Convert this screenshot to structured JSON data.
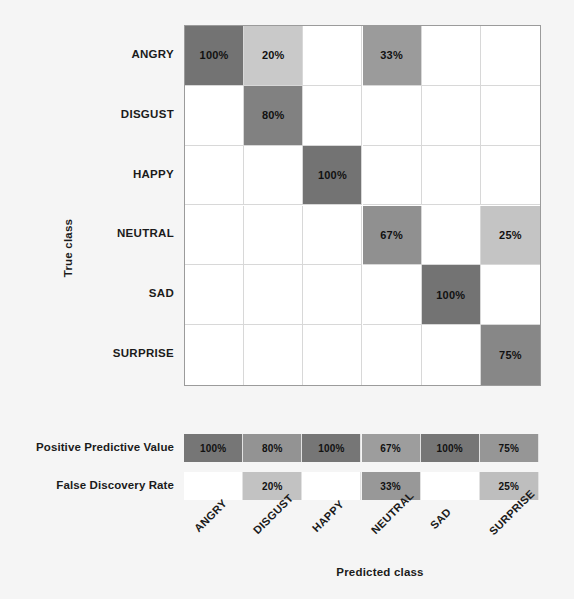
{
  "chart_data": {
    "type": "heatmap",
    "title": "",
    "xlabel": "Predicted class",
    "ylabel": "True class",
    "categories": [
      "ANGRY",
      "DISGUST",
      "HAPPY",
      "NEUTRAL",
      "SAD",
      "SURPRISE"
    ],
    "row_categories": [
      "ANGRY",
      "DISGUST",
      "HAPPY",
      "NEUTRAL",
      "SAD",
      "SURPRISE"
    ],
    "col_categories": [
      "ANGRY",
      "DISGUST",
      "HAPPY",
      "NEUTRAL",
      "SAD",
      "SURPRISE"
    ],
    "cell_unit": "%",
    "grid": true,
    "legend": "none",
    "matrix": [
      [
        {
          "text": "100%",
          "value": 100,
          "color": "#737373"
        },
        {
          "text": "20%",
          "value": 20,
          "color": "#c9c9c9"
        },
        {
          "text": "",
          "value": 0,
          "color": "#ffffff"
        },
        {
          "text": "33%",
          "value": 33,
          "color": "#9b9b9b"
        },
        {
          "text": "",
          "value": 0,
          "color": "#ffffff"
        },
        {
          "text": "",
          "value": 0,
          "color": "#ffffff"
        }
      ],
      [
        {
          "text": "",
          "value": 0,
          "color": "#ffffff"
        },
        {
          "text": "80%",
          "value": 80,
          "color": "#818181"
        },
        {
          "text": "",
          "value": 0,
          "color": "#ffffff"
        },
        {
          "text": "",
          "value": 0,
          "color": "#ffffff"
        },
        {
          "text": "",
          "value": 0,
          "color": "#ffffff"
        },
        {
          "text": "",
          "value": 0,
          "color": "#ffffff"
        }
      ],
      [
        {
          "text": "",
          "value": 0,
          "color": "#ffffff"
        },
        {
          "text": "",
          "value": 0,
          "color": "#ffffff"
        },
        {
          "text": "100%",
          "value": 100,
          "color": "#737373"
        },
        {
          "text": "",
          "value": 0,
          "color": "#ffffff"
        },
        {
          "text": "",
          "value": 0,
          "color": "#ffffff"
        },
        {
          "text": "",
          "value": 0,
          "color": "#ffffff"
        }
      ],
      [
        {
          "text": "",
          "value": 0,
          "color": "#ffffff"
        },
        {
          "text": "",
          "value": 0,
          "color": "#ffffff"
        },
        {
          "text": "",
          "value": 0,
          "color": "#ffffff"
        },
        {
          "text": "67%",
          "value": 67,
          "color": "#909090"
        },
        {
          "text": "",
          "value": 0,
          "color": "#ffffff"
        },
        {
          "text": "25%",
          "value": 25,
          "color": "#c4c4c4"
        }
      ],
      [
        {
          "text": "",
          "value": 0,
          "color": "#ffffff"
        },
        {
          "text": "",
          "value": 0,
          "color": "#ffffff"
        },
        {
          "text": "",
          "value": 0,
          "color": "#ffffff"
        },
        {
          "text": "",
          "value": 0,
          "color": "#ffffff"
        },
        {
          "text": "100%",
          "value": 100,
          "color": "#737373"
        },
        {
          "text": "",
          "value": 0,
          "color": "#ffffff"
        }
      ],
      [
        {
          "text": "",
          "value": 0,
          "color": "#ffffff"
        },
        {
          "text": "",
          "value": 0,
          "color": "#ffffff"
        },
        {
          "text": "",
          "value": 0,
          "color": "#ffffff"
        },
        {
          "text": "",
          "value": 0,
          "color": "#ffffff"
        },
        {
          "text": "",
          "value": 0,
          "color": "#ffffff"
        },
        {
          "text": "75%",
          "value": 75,
          "color": "#878787"
        }
      ]
    ],
    "summary_rows": [
      {
        "label": "Positive Predictive Value",
        "cells": [
          {
            "text": "100%",
            "value": 100,
            "color": "#767676"
          },
          {
            "text": "80%",
            "value": 80,
            "color": "#939393"
          },
          {
            "text": "100%",
            "value": 100,
            "color": "#767676"
          },
          {
            "text": "67%",
            "value": 67,
            "color": "#9d9d9d"
          },
          {
            "text": "100%",
            "value": 100,
            "color": "#767676"
          },
          {
            "text": "75%",
            "value": 75,
            "color": "#969696"
          }
        ]
      },
      {
        "label": "False Discovery Rate",
        "cells": [
          {
            "text": "",
            "value": 0,
            "color": "#ffffff"
          },
          {
            "text": "20%",
            "value": 20,
            "color": "#c2c2c2"
          },
          {
            "text": "",
            "value": 0,
            "color": "#ffffff"
          },
          {
            "text": "33%",
            "value": 33,
            "color": "#989898"
          },
          {
            "text": "",
            "value": 0,
            "color": "#ffffff"
          },
          {
            "text": "25%",
            "value": 25,
            "color": "#bebebe"
          }
        ]
      }
    ]
  },
  "axes": {
    "y_title": "True class",
    "x_title": "Predicted class"
  }
}
